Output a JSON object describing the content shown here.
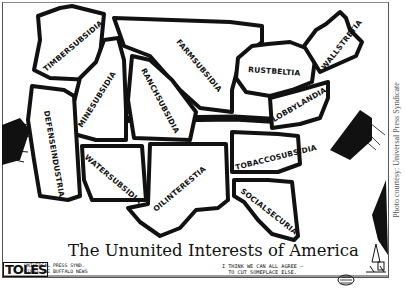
{
  "cartoon": {
    "title": "The Ununited Interests of America",
    "artist_signature": "TOLES",
    "syndication_line1": "UNIVERSAL PRESS SYND.",
    "syndication_line2": "©1993 THE BUFFALO NEWS",
    "speech_line1": "I THINK WE CAN ALL AGREE —",
    "speech_line2": "TO CUT SOMEPLACE ELSE.",
    "photo_credit": "Photo courtesy: Universal Press Syndicate"
  },
  "regions": [
    {
      "id": "timbersubsidia",
      "label": "TIMBERSUBSIDIA"
    },
    {
      "id": "minesubsidia",
      "label": "MINESUBSIDIA"
    },
    {
      "id": "farmsubsidia",
      "label": "FARMSUBSIDIA"
    },
    {
      "id": "ranchsubsidia",
      "label": "RANCHSUBSIDIA"
    },
    {
      "id": "rustbeltia",
      "label": "RUSTBELTIA"
    },
    {
      "id": "wallstretia",
      "label": "WALLSTRETIA"
    },
    {
      "id": "lobbylandia",
      "label": "LOBBYLANDIA"
    },
    {
      "id": "defenseindustria",
      "label": "DEFENSEINDUSTRIA"
    },
    {
      "id": "watersubsidia",
      "label": "WATERSUBSIDIA"
    },
    {
      "id": "oilinterestia",
      "label": "OILINTERESTIA"
    },
    {
      "id": "tobaccosubsidia",
      "label": "TOBACCOSUBSIDIA"
    },
    {
      "id": "socialsecuria",
      "label": "SOCIALSECURIA"
    }
  ],
  "colors": {
    "ink": "#111111",
    "paper": "#ffffff",
    "credit": "#555555"
  }
}
